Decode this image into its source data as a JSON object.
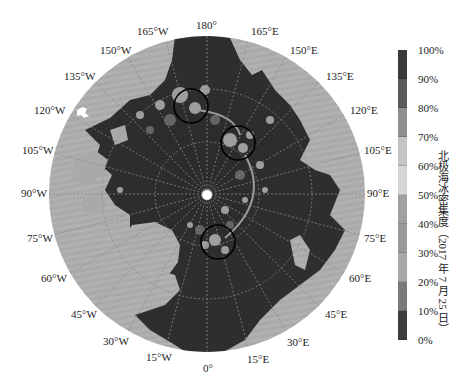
{
  "map": {
    "projection": "north-polar-stereographic",
    "center": [
      207,
      194
    ],
    "radius": 158,
    "colors": {
      "land": "#a9a9a9",
      "ocean": "#2e2e2e",
      "ice_light": "#c8c8c8",
      "ice_mid": "#7d7d7d",
      "gridline": "#888888",
      "circle": "#000000",
      "pole_dot": "#ffffff"
    },
    "longitude_labels": [
      {
        "text": "180°",
        "x": 196,
        "y": 20
      },
      {
        "text": "165°E",
        "x": 251,
        "y": 26
      },
      {
        "text": "150°E",
        "x": 290,
        "y": 45
      },
      {
        "text": "135°E",
        "x": 326,
        "y": 71
      },
      {
        "text": "120°E",
        "x": 350,
        "y": 105
      },
      {
        "text": "105°E",
        "x": 364,
        "y": 145
      },
      {
        "text": "90°E",
        "x": 367,
        "y": 188
      },
      {
        "text": "75°E",
        "x": 364,
        "y": 233
      },
      {
        "text": "60°E",
        "x": 349,
        "y": 273
      },
      {
        "text": "45°E",
        "x": 325,
        "y": 309
      },
      {
        "text": "30°E",
        "x": 287,
        "y": 337
      },
      {
        "text": "15°E",
        "x": 247,
        "y": 354
      },
      {
        "text": "0°",
        "x": 203,
        "y": 363
      },
      {
        "text": "15°W",
        "x": 146,
        "y": 352
      },
      {
        "text": "30°W",
        "x": 103,
        "y": 336
      },
      {
        "text": "45°W",
        "x": 71,
        "y": 309
      },
      {
        "text": "60°W",
        "x": 41,
        "y": 273
      },
      {
        "text": "75°W",
        "x": 27,
        "y": 233
      },
      {
        "text": "90°W",
        "x": 21,
        "y": 188
      },
      {
        "text": "105°W",
        "x": 22,
        "y": 145
      },
      {
        "text": "120°W",
        "x": 34,
        "y": 105
      },
      {
        "text": "135°W",
        "x": 64,
        "y": 71
      },
      {
        "text": "150°W",
        "x": 100,
        "y": 45
      },
      {
        "text": "165°W",
        "x": 137,
        "y": 26
      }
    ],
    "highlight_circles": [
      {
        "cx": 191,
        "cy": 106,
        "r": 17
      },
      {
        "cx": 238,
        "cy": 143,
        "r": 17
      },
      {
        "cx": 218,
        "cy": 242,
        "r": 17
      }
    ],
    "north_pole_marker": {
      "cx": 207,
      "cy": 195,
      "r": 5
    }
  },
  "colorbar": {
    "title": "北极海冰密集度（2017 年 7 月 25 日）",
    "ticks": [
      "100%",
      "90%",
      "80%",
      "70%",
      "60%",
      "50%",
      "40%",
      "30%",
      "20%",
      "10%",
      "0%"
    ],
    "segments": [
      "#3a3a3a",
      "#5a5a5a",
      "#8e8e8e",
      "#c4c4c4",
      "#d6d6d6",
      "#a0a0a0",
      "#9a9a9a",
      "#a8a8a8",
      "#7a7a7a",
      "#3e3e3e"
    ]
  }
}
